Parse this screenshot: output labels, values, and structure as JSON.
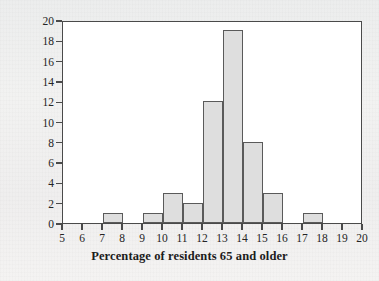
{
  "chart_data": {
    "type": "bar",
    "title": "",
    "xlabel": "Percentage of residents 65 and older",
    "ylabel": "Number of states",
    "xlim": [
      5,
      20
    ],
    "ylim": [
      0,
      20
    ],
    "xticks": [
      5,
      6,
      7,
      8,
      9,
      10,
      11,
      12,
      13,
      14,
      15,
      16,
      17,
      18,
      19,
      20
    ],
    "yticks": [
      0,
      2,
      4,
      6,
      8,
      10,
      12,
      14,
      16,
      18,
      20
    ],
    "grid": false,
    "legend": "none",
    "bin_width": 1,
    "bin_edges": [
      5,
      6,
      7,
      8,
      9,
      10,
      11,
      12,
      13,
      14,
      15,
      16,
      17,
      18,
      19,
      20
    ],
    "categories": [
      "5-6",
      "6-7",
      "7-8",
      "8-9",
      "9-10",
      "10-11",
      "11-12",
      "12-13",
      "13-14",
      "14-15",
      "15-16",
      "16-17",
      "17-18",
      "18-19",
      "19-20"
    ],
    "values": [
      0,
      0,
      1,
      0,
      1,
      3,
      2,
      12,
      19,
      8,
      3,
      0,
      1,
      0,
      0
    ],
    "bar_fill_color": "#dedede",
    "bar_edge_color": "#5a5a5a",
    "axis_color": "#4a4a4a",
    "plot_background": "#ffffff",
    "page_background": "#f0f0f0"
  }
}
